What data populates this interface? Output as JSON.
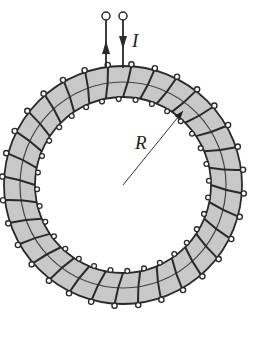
{
  "diagram": {
    "type": "toroid-coil",
    "labels": {
      "current": "I",
      "radius": "R"
    },
    "colors": {
      "core_fill": "#c8c8c8",
      "wire": "#2a2a2a",
      "background": "#ffffff"
    },
    "geometry": {
      "center": [
        123,
        185
      ],
      "outer_radius": 119,
      "inner_radius": 88,
      "mid_radius": 103,
      "winding_count": 32
    },
    "terminals": [
      {
        "x": 106,
        "direction": "up"
      },
      {
        "x": 123,
        "direction": "down"
      }
    ]
  }
}
